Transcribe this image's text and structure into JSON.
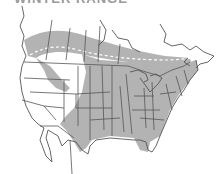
{
  "map": {
    "title": "WINTER RANGE",
    "region": "North America",
    "legend": {
      "range_fill_meaning": "range",
      "dashed_line_meaning": "boundary"
    },
    "colors": {
      "range": "#b3b3b3",
      "line": "#555555",
      "background": "#ffffff",
      "dashed_line": "#ffffff"
    }
  }
}
